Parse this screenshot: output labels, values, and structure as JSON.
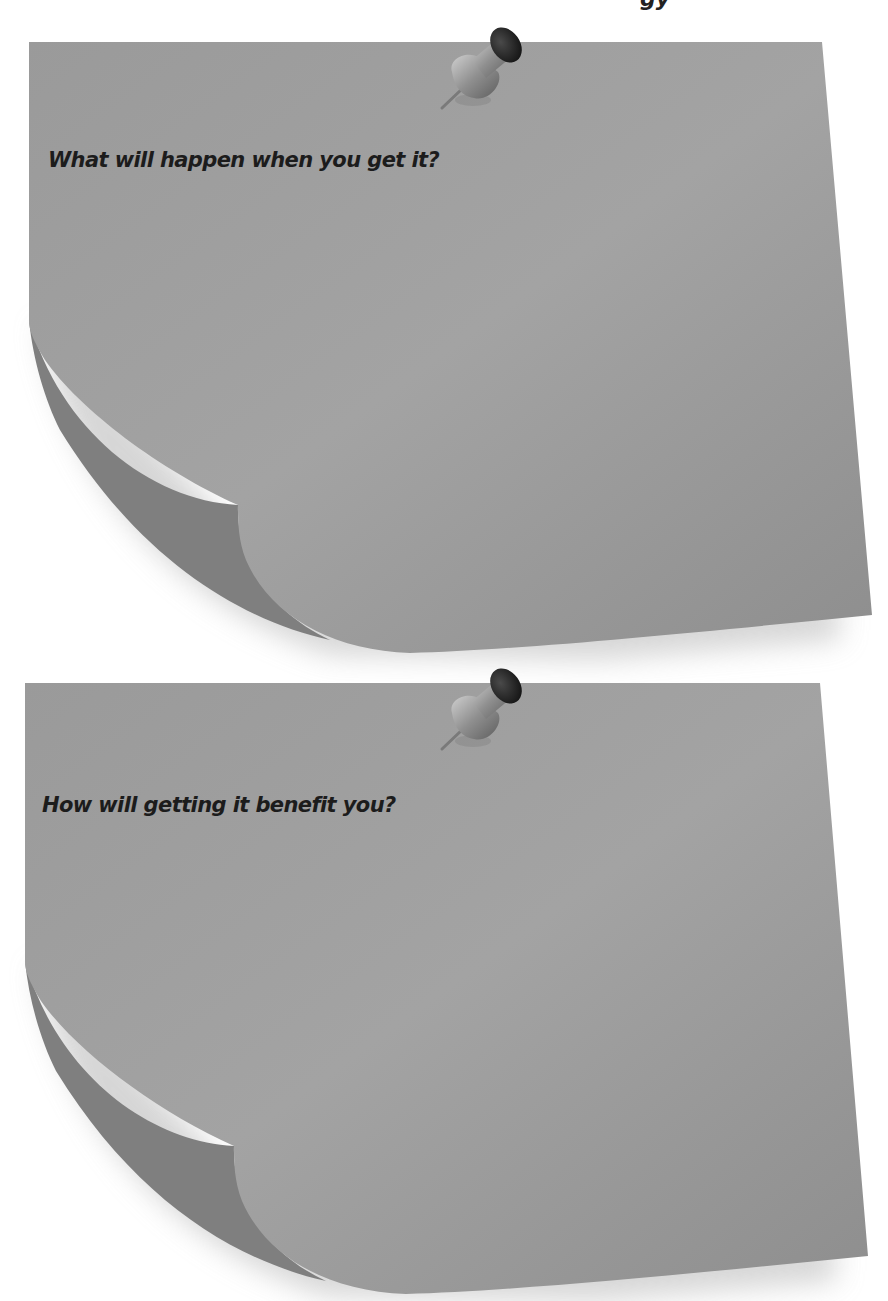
{
  "page": {
    "top_partial_text": "gy"
  },
  "notes": [
    {
      "prompt": "What will happen when you get it?",
      "pin": "pushpin-icon",
      "paper_color": "#9b9b9b"
    },
    {
      "prompt": "How will getting it benefit you?",
      "pin": "pushpin-icon",
      "paper_color": "#9b9b9b"
    }
  ],
  "colors": {
    "background": "#ffffff",
    "paper": "#9b9b9b",
    "paper_light": "#a6a6a6",
    "curl_underside": "#7e7e7e",
    "text": "#1c1c1c",
    "pin_head": "#2a2a2a",
    "pin_body": "#8a8a8a"
  }
}
